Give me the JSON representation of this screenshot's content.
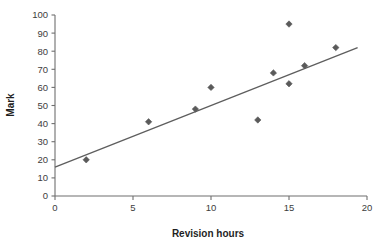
{
  "chart_data": {
    "type": "scatter",
    "title": "",
    "xlabel": "Revision hours",
    "ylabel": "Mark",
    "xlim": [
      0,
      20
    ],
    "ylim": [
      0,
      100
    ],
    "xticks": [
      0,
      5,
      10,
      15,
      20
    ],
    "yticks": [
      0,
      10,
      20,
      30,
      40,
      50,
      60,
      70,
      80,
      90,
      100
    ],
    "xtick_labels": [
      "0",
      "5",
      "10",
      "15",
      "20"
    ],
    "ytick_labels": [
      "0",
      "10",
      "20",
      "30",
      "40",
      "50",
      "60",
      "70",
      "80",
      "90",
      "100"
    ],
    "grid": false,
    "legend": false,
    "marker": "diamond",
    "marker_color": "#5a5a5a",
    "series": [
      {
        "name": "Students",
        "points": [
          {
            "x": 2,
            "y": 20
          },
          {
            "x": 6,
            "y": 41
          },
          {
            "x": 9,
            "y": 48
          },
          {
            "x": 10,
            "y": 60
          },
          {
            "x": 13,
            "y": 42
          },
          {
            "x": 14,
            "y": 68
          },
          {
            "x": 15,
            "y": 62
          },
          {
            "x": 15,
            "y": 95
          },
          {
            "x": 16,
            "y": 72
          },
          {
            "x": 18,
            "y": 82
          }
        ]
      }
    ],
    "trendline": {
      "name": "line of best fit",
      "color": "#5e5e5e",
      "x_start": 0,
      "y_start": 16,
      "x_end": 19.4,
      "y_end": 82
    }
  },
  "axes": {
    "x_title": "Revision hours",
    "y_title": "Mark"
  }
}
